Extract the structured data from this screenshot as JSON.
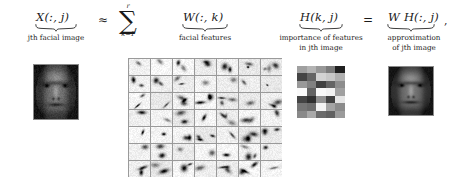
{
  "figure": {
    "type": "nmf-facial-decomposition-equation",
    "background": "#ffffff",
    "trailing_punctuation": ","
  },
  "equation": {
    "terms": [
      {
        "id": "X",
        "math": "X(:, j)",
        "caption_lines": [
          "jth facial image"
        ],
        "underbrace": true
      },
      {
        "id": "W",
        "math": "W(:, k)",
        "caption_lines": [
          "facial features"
        ],
        "underbrace": true
      },
      {
        "id": "H",
        "math": "H(k, j)",
        "caption_lines": [
          "importance of features",
          "in jth image"
        ],
        "underbrace": true
      },
      {
        "id": "WH",
        "math": "W H(:, j)",
        "caption_lines": [
          "approximation",
          "of jth image"
        ],
        "underbrace": true
      }
    ],
    "operators": [
      {
        "id": "approx",
        "symbol": "≈"
      },
      {
        "id": "equals",
        "symbol": "="
      }
    ],
    "summation": {
      "symbol": "∑",
      "upper_limit": "r",
      "lower_limit": "k=1"
    }
  },
  "labels": {
    "x_term": "X(:, j)",
    "x_caption": "jth facial image",
    "approx_symbol": "≈",
    "sum_symbol": "∑",
    "sum_upper": "r",
    "sum_lower": "k=1",
    "w_term": "W(:, k)",
    "w_caption": "facial features",
    "h_term": "H(k, j)",
    "h_caption_1": "importance of features",
    "h_caption_2": "in jth image",
    "equals_symbol": "=",
    "wh_term": "W H(:, j)",
    "wh_caption_1": "approximation",
    "wh_caption_2": "of jth image",
    "trailing_comma": ","
  },
  "panels": {
    "x_image": {
      "name": "jth-facial-image",
      "kind": "grayscale-face",
      "x": 33,
      "y": 64,
      "width": 44,
      "height": 54
    },
    "w_grid": {
      "name": "facial-features-grid",
      "kind": "feature-patch-grid",
      "rows": 7,
      "cols": 7,
      "x": 128,
      "y": 58,
      "width": 154,
      "height": 119
    },
    "h_heatmap": {
      "name": "importance-heatmap",
      "kind": "grayscale-heatmap",
      "rows": 7,
      "cols": 5,
      "x": 297,
      "y": 66,
      "width": 48,
      "height": 52
    },
    "wh_image": {
      "name": "approximation-image",
      "kind": "grayscale-face",
      "x": 388,
      "y": 66,
      "width": 44,
      "height": 48
    }
  }
}
